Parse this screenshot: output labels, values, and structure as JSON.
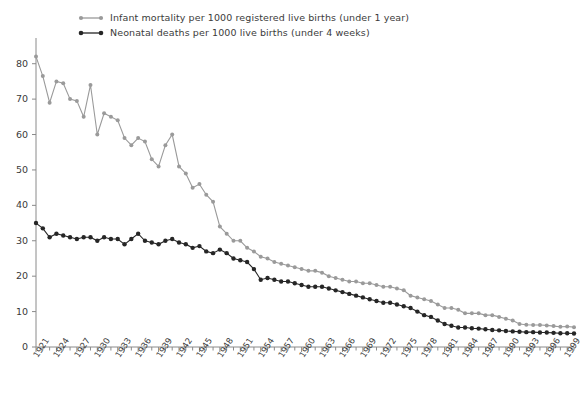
{
  "chart_data": {
    "type": "line",
    "title": "",
    "xlabel": "",
    "ylabel": "",
    "xlim": [
      1921,
      2000
    ],
    "ylim": [
      0,
      85
    ],
    "grid": false,
    "legend_position": "top-left",
    "y_ticks": [
      0,
      10,
      20,
      30,
      40,
      50,
      60,
      70,
      80
    ],
    "x_tick_labels": [
      1921,
      1924,
      1927,
      1930,
      1933,
      1936,
      1939,
      1942,
      1945,
      1948,
      1951,
      1954,
      1957,
      1960,
      1963,
      1966,
      1969,
      1972,
      1975,
      1978,
      1981,
      1984,
      1987,
      1990,
      1993,
      1996,
      1999
    ],
    "x": [
      1921,
      1922,
      1923,
      1924,
      1925,
      1926,
      1927,
      1928,
      1929,
      1930,
      1931,
      1932,
      1933,
      1934,
      1935,
      1936,
      1937,
      1938,
      1939,
      1940,
      1941,
      1942,
      1943,
      1944,
      1945,
      1946,
      1947,
      1948,
      1949,
      1950,
      1951,
      1952,
      1953,
      1954,
      1955,
      1956,
      1957,
      1958,
      1959,
      1960,
      1961,
      1962,
      1963,
      1964,
      1965,
      1966,
      1967,
      1968,
      1969,
      1970,
      1971,
      1972,
      1973,
      1974,
      1975,
      1976,
      1977,
      1978,
      1979,
      1980,
      1981,
      1982,
      1983,
      1984,
      1985,
      1986,
      1987,
      1988,
      1989,
      1990,
      1991,
      1992,
      1993,
      1994,
      1995,
      1996,
      1997,
      1998,
      1999,
      2000
    ],
    "series": [
      {
        "name": "Infant mortality per 1000 registered live births (under 1 year)",
        "color": "#9a9a9a",
        "marker": "circle",
        "values": [
          82.0,
          76.5,
          69.0,
          75.0,
          74.5,
          70.0,
          69.5,
          65.0,
          74.0,
          60.0,
          66.0,
          65.0,
          64.0,
          59.0,
          57.0,
          59.0,
          58.0,
          53.0,
          51.0,
          57.0,
          60.0,
          51.0,
          49.0,
          45.0,
          46.0,
          43.0,
          41.0,
          34.0,
          32.0,
          30.0,
          30.0,
          28.0,
          27.0,
          25.5,
          25.0,
          24.0,
          23.5,
          23.0,
          22.5,
          22.0,
          21.5,
          21.5,
          21.0,
          20.0,
          19.5,
          19.0,
          18.5,
          18.5,
          18.0,
          18.0,
          17.5,
          17.0,
          17.0,
          16.5,
          16.0,
          14.5,
          14.0,
          13.5,
          13.0,
          12.0,
          11.0,
          11.0,
          10.5,
          9.5,
          9.5,
          9.5,
          9.0,
          9.0,
          8.5,
          8.0,
          7.5,
          6.5,
          6.3,
          6.2,
          6.2,
          6.1,
          5.9,
          5.7,
          5.8,
          5.6
        ]
      },
      {
        "name": "Neonatal deaths per 1000 live births (under 4 weeks)",
        "color": "#262626",
        "marker": "circle",
        "values": [
          35.0,
          33.5,
          31.0,
          32.0,
          31.5,
          31.0,
          30.5,
          31.0,
          31.0,
          30.0,
          31.0,
          30.5,
          30.5,
          29.0,
          30.5,
          32.0,
          30.0,
          29.5,
          29.0,
          30.0,
          30.5,
          29.5,
          29.0,
          28.0,
          28.5,
          27.0,
          26.5,
          27.5,
          26.5,
          25.0,
          24.5,
          24.0,
          22.0,
          19.0,
          19.5,
          19.0,
          18.5,
          18.5,
          18.0,
          17.5,
          17.0,
          17.0,
          17.0,
          16.5,
          16.0,
          15.5,
          15.0,
          14.5,
          14.0,
          13.5,
          13.0,
          12.5,
          12.5,
          12.0,
          11.5,
          11.0,
          10.0,
          9.0,
          8.5,
          7.5,
          6.5,
          6.0,
          5.5,
          5.5,
          5.3,
          5.2,
          5.0,
          4.8,
          4.7,
          4.5,
          4.4,
          4.3,
          4.2,
          4.2,
          4.1,
          4.1,
          4.0,
          3.9,
          3.9,
          3.8
        ]
      }
    ]
  },
  "legend": {
    "items": [
      {
        "label": "Infant mortality per 1000 registered live births (under 1 year)",
        "color": "#9a9a9a"
      },
      {
        "label": "Neonatal deaths per 1000 live births (under 4 weeks)",
        "color": "#262626"
      }
    ]
  },
  "axes": {
    "y_tick_labels": [
      "80",
      "70",
      "60",
      "50",
      "40",
      "30",
      "20",
      "10",
      "0"
    ],
    "x_tick_labels": [
      "1921",
      "1924",
      "1927",
      "1930",
      "1933",
      "1936",
      "1939",
      "1942",
      "1945",
      "1948",
      "1951",
      "1954",
      "1957",
      "1960",
      "1963",
      "1966",
      "1969",
      "1972",
      "1975",
      "1978",
      "1981",
      "1984",
      "1987",
      "1990",
      "1993",
      "1996",
      "1999"
    ],
    "axis_color": "#8a8a8a"
  },
  "caption": {
    "text": ""
  }
}
